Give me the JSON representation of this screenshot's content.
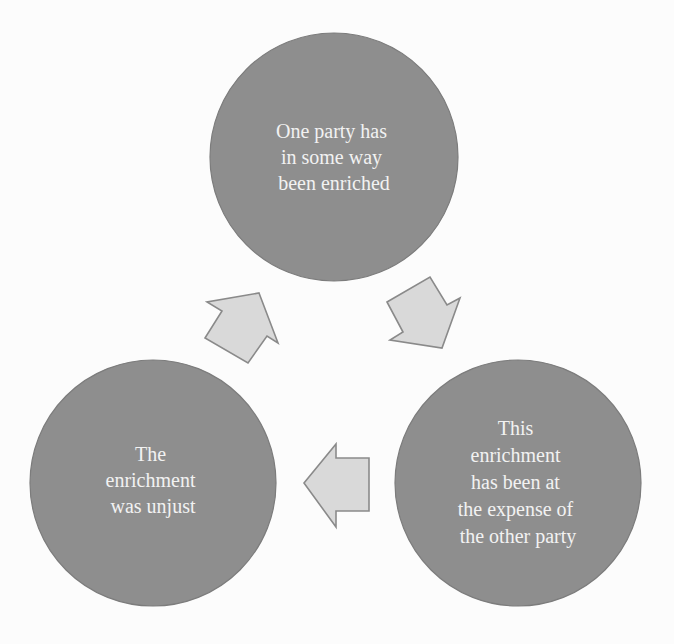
{
  "diagram": {
    "type": "cycle",
    "colors": {
      "background": "#fcfcfc",
      "circle_fill": "#8e8e8e",
      "circle_stroke": "#7c7c7c",
      "text": "#f2f2f2",
      "arrow_fill": "#d9d9d9",
      "arrow_stroke": "#8a8a8a"
    },
    "nodes": [
      {
        "id": "top",
        "lines": [
          "One party has",
          "in some way",
          "been enriched"
        ]
      },
      {
        "id": "right",
        "lines": [
          "This",
          "enrichment",
          "has been at",
          "the expense of",
          "the other party"
        ]
      },
      {
        "id": "left",
        "lines": [
          "The",
          "enrichment",
          "was unjust"
        ]
      }
    ],
    "edges": [
      {
        "from": "top",
        "to": "right",
        "direction": "down-right"
      },
      {
        "from": "right",
        "to": "left",
        "direction": "left"
      },
      {
        "from": "left",
        "to": "top",
        "direction": "up-right"
      }
    ]
  }
}
